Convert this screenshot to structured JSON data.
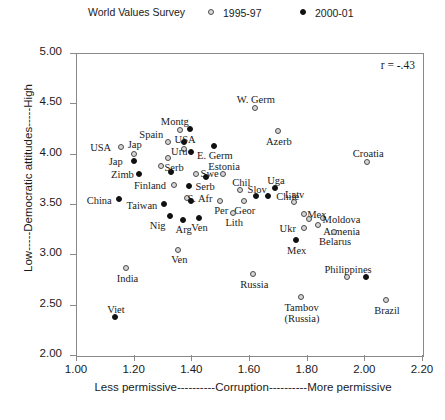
{
  "legend": {
    "title": "World Values Survey",
    "entries": [
      {
        "label": "1995-97",
        "marker": "open-circle-icon"
      },
      {
        "label": "2000-01",
        "marker": "filled-circle-icon"
      }
    ]
  },
  "annotation": "r = -.43",
  "chart_data": {
    "type": "scatter",
    "title": "World Values Survey",
    "xlabel": "Less permissive----------Corruption----------More permissive",
    "ylabel": "Low-----Democratic attitudes-----High",
    "xlim": [
      1.0,
      2.2
    ],
    "ylim": [
      2.0,
      5.0
    ],
    "xticks": [
      "1.00",
      "1.20",
      "1.40",
      "1.60",
      "1.80",
      "2.00",
      "2.20"
    ],
    "yticks": [
      "2.00",
      "2.50",
      "3.00",
      "3.50",
      "4.00",
      "4.50",
      "5.00"
    ],
    "grid": false,
    "legend_position": "top",
    "annotations": [
      {
        "text": "r = -.43",
        "x": 2.13,
        "y": 4.85
      }
    ],
    "series": [
      {
        "name": "1995-97",
        "marker": "open-circle",
        "points": [
          {
            "label": "USA",
            "x": 1.155,
            "y": 4.07,
            "label_dx": -20,
            "label_dy": -5
          },
          {
            "label": "Jap",
            "x": 1.2,
            "y": 4.0,
            "label_dx": 1,
            "label_dy": -15
          },
          {
            "label": "Spain",
            "x": 1.32,
            "y": 4.12,
            "label_dx": -17,
            "label_dy": -13
          },
          {
            "label": "USA",
            "x": 1.375,
            "y": 4.05,
            "label_dx": 1,
            "label_dy": -15
          },
          {
            "label": "Montg",
            "x": 1.36,
            "y": 4.24,
            "label_dx": -5,
            "label_dy": -14
          },
          {
            "label": "Uru",
            "x": 1.32,
            "y": 3.96,
            "label_dx": 11,
            "label_dy": -12
          },
          {
            "label": "W. Germ",
            "x": 1.62,
            "y": 4.45,
            "label_dx": 1,
            "label_dy": -14
          },
          {
            "label": "Azerb",
            "x": 1.7,
            "y": 4.23,
            "label_dx": 1,
            "label_dy": 5
          },
          {
            "label": "Croatia",
            "x": 2.01,
            "y": 3.92,
            "label_dx": 1,
            "label_dy": -14
          },
          {
            "label": "Swe",
            "x": 1.415,
            "y": 3.8,
            "label_dx": 14,
            "label_dy": -6
          },
          {
            "label": "Estonia",
            "x": 1.51,
            "y": 3.8,
            "label_dx": 1,
            "label_dy": -13
          },
          {
            "label": "Serb",
            "x": 1.295,
            "y": 3.88,
            "label_dx": 13,
            "label_dy": -4
          },
          {
            "label": "Finland",
            "x": 1.34,
            "y": 3.69,
            "label_dx": -24,
            "label_dy": -5
          },
          {
            "label": "S. Afr",
            "x": 1.385,
            "y": 3.56,
            "label_dx": 13,
            "label_dy": -5
          },
          {
            "label": "Chil",
            "x": 1.57,
            "y": 3.64,
            "label_dx": 1,
            "label_dy": -13
          },
          {
            "label": "Per",
            "x": 1.5,
            "y": 3.53,
            "label_dx": 1,
            "label_dy": 4
          },
          {
            "label": "Geor",
            "x": 1.582,
            "y": 3.53,
            "label_dx": 1,
            "label_dy": 4
          },
          {
            "label": "Lith",
            "x": 1.545,
            "y": 3.41,
            "label_dx": 1,
            "label_dy": 4
          },
          {
            "label": "Latv",
            "x": 1.755,
            "y": 3.52,
            "label_dx": 1,
            "label_dy": -13
          },
          {
            "label": "Mex",
            "x": 1.79,
            "y": 3.4,
            "label_dx": 13,
            "label_dy": -5
          },
          {
            "label": "Moldova",
            "x": 1.855,
            "y": 3.36,
            "label_dx": 19,
            "label_dy": -4
          },
          {
            "label": "Armenia",
            "x": 1.838,
            "y": 3.29,
            "label_dx": 24,
            "label_dy": 1
          },
          {
            "label": "Ukr",
            "x": 1.79,
            "y": 3.26,
            "label_dx": -16,
            "label_dy": -5
          },
          {
            "label": "Belarus",
            "x": 1.895,
            "y": 3.22,
            "label_dx": 1,
            "label_dy": 4
          },
          {
            "label": "Ven",
            "x": 1.355,
            "y": 3.04,
            "label_dx": 1,
            "label_dy": 4
          },
          {
            "label": "India",
            "x": 1.175,
            "y": 2.86,
            "label_dx": 1,
            "label_dy": 5
          },
          {
            "label": "Russia",
            "x": 1.615,
            "y": 2.8,
            "label_dx": 1,
            "label_dy": 5
          },
          {
            "label": "Tambov (Russia)",
            "x": 1.78,
            "y": 2.58,
            "label_dx": 1,
            "label_dy": 5
          },
          {
            "label": "Brazil",
            "x": 2.075,
            "y": 2.55,
            "label_dx": 1,
            "label_dy": 5
          },
          {
            "label": "Philippines",
            "x": 1.94,
            "y": 2.77,
            "label_dx": 1,
            "label_dy": -13
          },
          {
            "label": "Mex",
            "x": 1.808,
            "y": 3.35,
            "label_dx": -999,
            "label_dy": -999
          }
        ]
      },
      {
        "name": "2000-01",
        "marker": "filled-circle",
        "points": [
          {
            "label": "Jap",
            "x": 1.2,
            "y": 3.93,
            "label_dx": -18,
            "label_dy": -5
          },
          {
            "label": "Zimb",
            "x": 1.22,
            "y": 3.8,
            "label_dx": -17,
            "label_dy": -5
          },
          {
            "label": "Spain",
            "x": 1.375,
            "y": 4.12,
            "label_dx": -999,
            "label_dy": -999
          },
          {
            "label": "USA",
            "x": 1.4,
            "y": 4.02,
            "label_dx": -999,
            "label_dy": -999
          },
          {
            "label": "Montg",
            "x": 1.395,
            "y": 4.25,
            "label_dx": -999,
            "label_dy": -999
          },
          {
            "label": "E. Germ",
            "x": 1.478,
            "y": 4.08,
            "label_dx": 1,
            "label_dy": 4
          },
          {
            "label": "Serb",
            "x": 1.33,
            "y": 3.82,
            "label_dx": -999,
            "label_dy": -999
          },
          {
            "label": "Serb",
            "x": 1.392,
            "y": 3.68,
            "label_dx": 16,
            "label_dy": -5
          },
          {
            "label": "Swe",
            "x": 1.45,
            "y": 3.77,
            "label_dx": -999,
            "label_dy": -999
          },
          {
            "label": "China",
            "x": 1.15,
            "y": 3.55,
            "label_dx": -20,
            "label_dy": -4
          },
          {
            "label": "Taiwan",
            "x": 1.305,
            "y": 3.5,
            "label_dx": -22,
            "label_dy": -4
          },
          {
            "label": "S. Afr",
            "x": 1.4,
            "y": 3.53,
            "label_dx": -999,
            "label_dy": -999
          },
          {
            "label": "Nig",
            "x": 1.325,
            "y": 3.38,
            "label_dx": -12,
            "label_dy": 4
          },
          {
            "label": "Arg",
            "x": 1.37,
            "y": 3.34,
            "label_dx": 1,
            "label_dy": 4
          },
          {
            "label": "Ven",
            "x": 1.425,
            "y": 3.36,
            "label_dx": 1,
            "label_dy": 4
          },
          {
            "label": "Uga",
            "x": 1.69,
            "y": 3.66,
            "label_dx": 1,
            "label_dy": -13
          },
          {
            "label": "Slov",
            "x": 1.625,
            "y": 3.58,
            "label_dx": 1,
            "label_dy": -12
          },
          {
            "label": "Chile",
            "x": 1.665,
            "y": 3.58,
            "label_dx": 20,
            "label_dy": -5
          },
          {
            "label": "Mex",
            "x": 1.762,
            "y": 3.14,
            "label_dx": 1,
            "label_dy": 5
          },
          {
            "label": "Philippines",
            "x": 2.005,
            "y": 2.77,
            "label_dx": -999,
            "label_dy": -999
          },
          {
            "label": "Viet",
            "x": 1.135,
            "y": 2.38,
            "label_dx": 1,
            "label_dy": -13
          }
        ]
      }
    ]
  }
}
